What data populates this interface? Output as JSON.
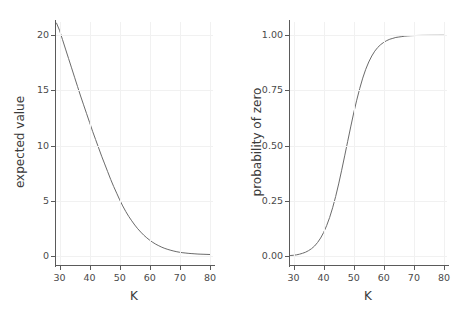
{
  "figure": {
    "background": "#ffffff",
    "curve_color": "#6b6b6b",
    "grid_color": "#f1f1f1",
    "spine_color": "#5a5a5a",
    "panel_count": 2
  },
  "chart_data": [
    {
      "type": "line",
      "panel": "left",
      "title": "",
      "xlabel": "K",
      "ylabel": "expected value",
      "xlim": [
        28.5,
        81
      ],
      "ylim": [
        -0.8,
        21.2
      ],
      "xticks": [
        30,
        40,
        50,
        60,
        70,
        80
      ],
      "xticklabels": [
        "30",
        "40",
        "50",
        "60",
        "70",
        "80"
      ],
      "yticks": [
        0,
        5,
        10,
        15,
        20
      ],
      "yticklabels": [
        "0",
        "5",
        "10",
        "15",
        "20"
      ],
      "grid": true,
      "legend": "none",
      "x": [
        29,
        30,
        31,
        32,
        33,
        34,
        35,
        36,
        37,
        38,
        39,
        40,
        41,
        42,
        43,
        44,
        45,
        46,
        47,
        48,
        49,
        50,
        51,
        52,
        53,
        54,
        55,
        56,
        57,
        58,
        59,
        60,
        61,
        62,
        63,
        64,
        65,
        66,
        67,
        68,
        69,
        70,
        71,
        72,
        73,
        74,
        75,
        76,
        77,
        78,
        79,
        80
      ],
      "values": [
        21.1,
        20.45,
        19.6,
        18.75,
        17.9,
        17.05,
        16.2,
        15.35,
        14.5,
        13.7,
        12.9,
        12.1,
        11.3,
        10.55,
        9.8,
        9.05,
        8.35,
        7.65,
        6.95,
        6.3,
        5.7,
        5.1,
        4.55,
        4.05,
        3.6,
        3.2,
        2.82,
        2.48,
        2.18,
        1.9,
        1.66,
        1.44,
        1.25,
        1.08,
        0.94,
        0.81,
        0.7,
        0.61,
        0.53,
        0.46,
        0.4,
        0.35,
        0.31,
        0.28,
        0.25,
        0.23,
        0.21,
        0.19,
        0.18,
        0.17,
        0.16,
        0.15
      ]
    },
    {
      "type": "line",
      "panel": "right",
      "title": "",
      "xlabel": "K",
      "ylabel": "probability of zero",
      "xlim": [
        28.5,
        81
      ],
      "ylim": [
        -0.04,
        1.06
      ],
      "xticks": [
        30,
        40,
        50,
        60,
        70,
        80
      ],
      "xticklabels": [
        "30",
        "40",
        "50",
        "60",
        "70",
        "80"
      ],
      "yticks": [
        0.0,
        0.25,
        0.5,
        0.75,
        1.0
      ],
      "yticklabels": [
        "0.00",
        "0.25",
        "0.50",
        "0.75",
        "1.00"
      ],
      "grid": true,
      "legend": "none",
      "x": [
        29,
        30,
        31,
        32,
        33,
        34,
        35,
        36,
        37,
        38,
        39,
        40,
        41,
        42,
        43,
        44,
        45,
        46,
        47,
        48,
        49,
        50,
        51,
        52,
        53,
        54,
        55,
        56,
        57,
        58,
        59,
        60,
        61,
        62,
        63,
        64,
        65,
        66,
        67,
        68,
        69,
        70,
        71,
        72,
        73,
        74,
        75,
        76,
        77,
        78,
        79,
        80
      ],
      "values": [
        0.003,
        0.004,
        0.006,
        0.009,
        0.013,
        0.018,
        0.025,
        0.034,
        0.046,
        0.062,
        0.082,
        0.107,
        0.138,
        0.175,
        0.219,
        0.27,
        0.327,
        0.389,
        0.454,
        0.52,
        0.585,
        0.648,
        0.706,
        0.759,
        0.806,
        0.846,
        0.879,
        0.906,
        0.928,
        0.945,
        0.958,
        0.968,
        0.976,
        0.982,
        0.986,
        0.99,
        0.992,
        0.994,
        0.996,
        0.997,
        0.998,
        0.9985,
        0.999,
        0.9992,
        0.9994,
        0.9995,
        0.9996,
        0.9997,
        0.9998,
        0.9998,
        0.9999,
        0.9999
      ]
    }
  ],
  "panels": {
    "left": {
      "xlabel": "K",
      "ylabel": "expected value",
      "xticklabels": [
        "30",
        "40",
        "50",
        "60",
        "70",
        "80"
      ],
      "yticklabels": [
        "20",
        "15",
        "10",
        "5",
        "0"
      ]
    },
    "right": {
      "xlabel": "K",
      "ylabel": "probability of zero",
      "xticklabels": [
        "30",
        "40",
        "50",
        "60",
        "70",
        "80"
      ],
      "yticklabels": [
        "1.00",
        "0.75",
        "0.50",
        "0.25",
        "0.00"
      ]
    }
  }
}
